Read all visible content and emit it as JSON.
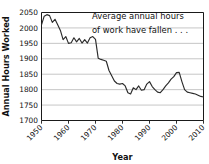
{
  "chart_data": {
    "type": "line",
    "title": "",
    "xlabel": "Year",
    "ylabel": "Annual Hours Worked",
    "xlim": [
      1950,
      2010
    ],
    "ylim": [
      1700,
      2050
    ],
    "grid": true,
    "legend": false,
    "annotation": {
      "line1": "Average annual hours",
      "line2": "of work have fallen . . ."
    },
    "yticks": [
      1700,
      1750,
      1800,
      1850,
      1900,
      1950,
      2000,
      2050
    ],
    "ytick_labels": [
      "1700",
      "1750",
      "1800",
      "1850",
      "1900",
      "1950",
      "2000",
      "2050"
    ],
    "xticks": [
      1950,
      1960,
      1970,
      1980,
      1990,
      2000,
      2010
    ],
    "xtick_labels": [
      "1950",
      "1960",
      "1970",
      "1980",
      "1990",
      "2000",
      "2010"
    ],
    "series": [
      {
        "name": "Annual Hours Worked",
        "color": "#2b2b2b",
        "x": [
          1950,
          1951,
          1952,
          1953,
          1954,
          1955,
          1956,
          1957,
          1958,
          1959,
          1960,
          1961,
          1962,
          1963,
          1964,
          1965,
          1966,
          1967,
          1968,
          1969,
          1970,
          1971,
          1972,
          1973,
          1974,
          1975,
          1976,
          1977,
          1978,
          1979,
          1980,
          1981,
          1982,
          1983,
          1984,
          1985,
          1986,
          1987,
          1988,
          1989,
          1990,
          1991,
          1992,
          1993,
          1994,
          1995,
          1996,
          1997,
          1998,
          1999,
          2000,
          2001,
          2002,
          2003,
          2004,
          2005,
          2006,
          2007,
          2008,
          2009,
          2010
        ],
        "values": [
          2010,
          2038,
          2043,
          2040,
          2018,
          2028,
          2010,
          1992,
          1962,
          1972,
          1950,
          1952,
          1968,
          1955,
          1966,
          1951,
          1962,
          1951,
          1968,
          1972,
          1963,
          1902,
          1898,
          1895,
          1892,
          1862,
          1845,
          1828,
          1820,
          1818,
          1820,
          1812,
          1790,
          1786,
          1806,
          1800,
          1812,
          1798,
          1800,
          1818,
          1826,
          1810,
          1800,
          1792,
          1790,
          1800,
          1812,
          1822,
          1834,
          1842,
          1855,
          1856,
          1826,
          1800,
          1792,
          1790,
          1788,
          1786,
          1782,
          1778,
          1776
        ]
      }
    ]
  }
}
